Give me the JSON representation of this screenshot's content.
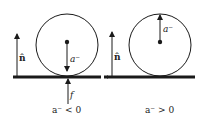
{
  "diagram": {
    "colors": {
      "ink": "#1a1a1a",
      "background": "#ffffff"
    },
    "left_panel": {
      "normal_label": "n̂",
      "acceleration_label": "a⁻",
      "friction_label": "f",
      "caption": "a⁻ < 0",
      "acceleration_direction": "down"
    },
    "right_panel": {
      "normal_label": "n̂",
      "acceleration_label": "a⁻",
      "caption": "a⁻ > 0",
      "acceleration_direction": "up"
    }
  }
}
